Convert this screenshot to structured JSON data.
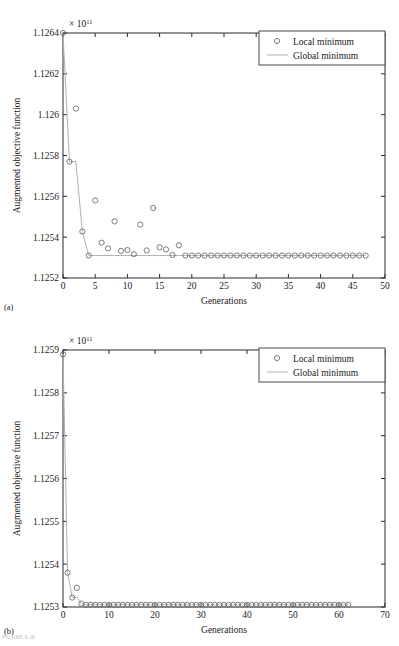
{
  "figure": {
    "caption_partial": "FIGURE 6.10",
    "panels": [
      {
        "letter": "(a)",
        "exponent_prefix": "× 10",
        "exponent_power": "11",
        "legend": {
          "local_label": "Local minimum",
          "global_label": "Global minimum"
        },
        "chart_data": {
          "type": "scatter",
          "title": "",
          "xlabel": "Generations",
          "ylabel": "Augmented objective function",
          "xlim": [
            0,
            50
          ],
          "ylim": [
            1.1252,
            1.1264
          ],
          "y_scale_factor": "× 10^11",
          "xticks": [
            0,
            5,
            10,
            15,
            20,
            25,
            30,
            35,
            40,
            45,
            50
          ],
          "xtick_labels": [
            "0",
            "5",
            "10",
            "15",
            "20",
            "25",
            "30",
            "35",
            "40",
            "45",
            "50"
          ],
          "yticks": [
            1.1252,
            1.1254,
            1.1256,
            1.1258,
            1.126,
            1.1262,
            1.1264
          ],
          "ytick_labels": [
            "1.1252",
            "1.1254",
            "1.1256",
            "1.1258",
            "1.126",
            "1.1262",
            "1.1264"
          ],
          "grid": false,
          "legend_position": "top-right",
          "series": [
            {
              "name": "Local minimum",
              "marker": "circle",
              "x": [
                0,
                1,
                2,
                3,
                4,
                5,
                6,
                7,
                8,
                9,
                10,
                11,
                12,
                13,
                14,
                15,
                16,
                17,
                18,
                19,
                20,
                21,
                22,
                23,
                24,
                25,
                26,
                27,
                28,
                29,
                30,
                31,
                32,
                33,
                34,
                35,
                36,
                37,
                38,
                39,
                40,
                41,
                42,
                43,
                44,
                45,
                46,
                47
              ],
              "y": [
                1.1264,
                1.12577,
                1.12603,
                1.125428,
                1.12531,
                1.12558,
                1.125373,
                1.125345,
                1.125477,
                1.125333,
                1.125337,
                1.125317,
                1.125462,
                1.125335,
                1.125543,
                1.12535,
                1.12534,
                1.125313,
                1.12536,
                1.12531,
                1.12531,
                1.12531,
                1.12531,
                1.12531,
                1.12531,
                1.12531,
                1.12531,
                1.12531,
                1.12531,
                1.12531,
                1.12531,
                1.12531,
                1.12531,
                1.12531,
                1.12531,
                1.12531,
                1.12531,
                1.12531,
                1.12531,
                1.12531,
                1.12531,
                1.12531,
                1.12531,
                1.12531,
                1.12531,
                1.12531,
                1.12531,
                1.12531
              ]
            },
            {
              "name": "Global minimum",
              "marker": "line",
              "x": [
                0,
                1,
                2,
                3,
                4,
                5,
                6,
                7,
                8,
                9,
                10,
                11,
                12,
                13,
                14,
                15,
                16,
                17,
                18,
                19,
                20,
                21,
                22,
                23,
                24,
                25,
                26,
                27,
                28,
                29,
                30,
                31,
                32,
                33,
                34,
                35,
                36,
                37,
                38,
                39,
                40,
                41,
                42,
                43,
                44,
                45,
                46,
                47
              ],
              "y": [
                1.1264,
                1.12577,
                1.12577,
                1.125428,
                1.12531,
                1.12531,
                1.12531,
                1.12531,
                1.12531,
                1.12531,
                1.12531,
                1.12531,
                1.12531,
                1.12531,
                1.12531,
                1.12531,
                1.12531,
                1.12531,
                1.12531,
                1.12531,
                1.12531,
                1.12531,
                1.12531,
                1.12531,
                1.12531,
                1.12531,
                1.12531,
                1.12531,
                1.12531,
                1.12531,
                1.12531,
                1.12531,
                1.12531,
                1.12531,
                1.12531,
                1.12531,
                1.12531,
                1.12531,
                1.12531,
                1.12531,
                1.12531,
                1.12531,
                1.12531,
                1.12531,
                1.12531,
                1.12531,
                1.12531,
                1.12531
              ]
            }
          ]
        }
      },
      {
        "letter": "(b)",
        "exponent_prefix": "× 10",
        "exponent_power": "11",
        "legend": {
          "local_label": "Local minimum",
          "global_label": "Global minimum"
        },
        "chart_data": {
          "type": "scatter",
          "title": "",
          "xlabel": "Generations",
          "ylabel": "Augmented objective function",
          "xlim": [
            0,
            70
          ],
          "ylim": [
            1.1253,
            1.1259
          ],
          "y_scale_factor": "× 10^11",
          "xticks": [
            0,
            10,
            20,
            30,
            40,
            50,
            60,
            70
          ],
          "xtick_labels": [
            "0",
            "10",
            "20",
            "30",
            "40",
            "50",
            "60",
            "70"
          ],
          "yticks": [
            1.1253,
            1.1254,
            1.1255,
            1.1256,
            1.1257,
            1.1258,
            1.1259
          ],
          "ytick_labels": [
            "1.1253",
            "1.1254",
            "1.1255",
            "1.1256",
            "1.1257",
            "1.1258",
            "1.1259"
          ],
          "grid": false,
          "legend_position": "top-right",
          "series": [
            {
              "name": "Local minimum",
              "marker": "circle",
              "x": [
                0,
                1,
                2,
                3,
                4,
                5,
                6,
                7,
                8,
                9,
                10,
                11,
                12,
                13,
                14,
                15,
                16,
                17,
                18,
                19,
                20,
                21,
                22,
                23,
                24,
                25,
                26,
                27,
                28,
                29,
                30,
                31,
                32,
                33,
                34,
                35,
                36,
                37,
                38,
                39,
                40,
                41,
                42,
                43,
                44,
                45,
                46,
                47,
                48,
                49,
                50,
                51,
                52,
                53,
                54,
                55,
                56,
                57,
                58,
                59,
                60,
                61,
                62
              ],
              "y": [
                1.12589,
                1.12538,
                1.125322,
                1.125345,
                1.125308,
                1.125305,
                1.125305,
                1.125305,
                1.125305,
                1.125305,
                1.125305,
                1.125305,
                1.125305,
                1.125305,
                1.125305,
                1.125305,
                1.125305,
                1.125305,
                1.125305,
                1.125305,
                1.125305,
                1.125305,
                1.125305,
                1.125305,
                1.125305,
                1.125305,
                1.125305,
                1.125305,
                1.125305,
                1.125305,
                1.125305,
                1.125305,
                1.125305,
                1.125305,
                1.125305,
                1.125305,
                1.125305,
                1.125305,
                1.125305,
                1.125305,
                1.125305,
                1.125305,
                1.125305,
                1.125305,
                1.125305,
                1.125305,
                1.125305,
                1.125305,
                1.125305,
                1.125305,
                1.125305,
                1.125305,
                1.125305,
                1.125305,
                1.125305,
                1.125305,
                1.125305,
                1.125305,
                1.125305,
                1.125305,
                1.125305,
                1.125305,
                1.125305
              ]
            },
            {
              "name": "Global minimum",
              "marker": "line",
              "x": [
                0,
                1,
                2,
                3,
                4,
                5,
                6,
                7,
                8,
                9,
                10,
                11,
                12,
                13,
                14,
                15,
                16,
                17,
                18,
                19,
                20,
                21,
                22,
                23,
                24,
                25,
                26,
                27,
                28,
                29,
                30,
                31,
                32,
                33,
                34,
                35,
                36,
                37,
                38,
                39,
                40,
                41,
                42,
                43,
                44,
                45,
                46,
                47,
                48,
                49,
                50,
                51,
                52,
                53,
                54,
                55,
                56,
                57,
                58,
                59,
                60,
                61,
                62
              ],
              "y": [
                1.12589,
                1.12538,
                1.125322,
                1.125322,
                1.125308,
                1.125305,
                1.125305,
                1.125305,
                1.125305,
                1.125305,
                1.125305,
                1.125305,
                1.125305,
                1.125305,
                1.125305,
                1.125305,
                1.125305,
                1.125305,
                1.125305,
                1.125305,
                1.125305,
                1.125305,
                1.125305,
                1.125305,
                1.125305,
                1.125305,
                1.125305,
                1.125305,
                1.125305,
                1.125305,
                1.125305,
                1.125305,
                1.125305,
                1.125305,
                1.125305,
                1.125305,
                1.125305,
                1.125305,
                1.125305,
                1.125305,
                1.125305,
                1.125305,
                1.125305,
                1.125305,
                1.125305,
                1.125305,
                1.125305,
                1.125305,
                1.125305,
                1.125305,
                1.125305,
                1.125305,
                1.125305,
                1.125305,
                1.125305,
                1.125305,
                1.125305,
                1.125305,
                1.125305,
                1.125305,
                1.125305,
                1.125305,
                1.125305
              ]
            }
          ]
        }
      }
    ]
  },
  "colors": {
    "axis": "#2b2b2b",
    "marker": "#6e6e6e",
    "global_line": "#b0b0b0",
    "text": "#1a1a1a",
    "background": "#ffffff"
  }
}
